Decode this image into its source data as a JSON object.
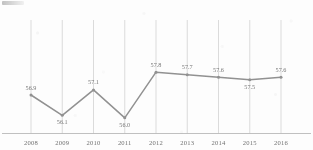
{
  "chart_data": {
    "type": "line",
    "title": "",
    "subtitle": "",
    "xlabel": "",
    "ylabel": "",
    "categories": [
      "2008",
      "2009",
      "2010",
      "2011",
      "2012",
      "2013",
      "2014",
      "2015",
      "2016"
    ],
    "values": [
      56.9,
      56.1,
      57.1,
      56.0,
      57.8,
      57.7,
      57.6,
      57.5,
      57.6
    ],
    "point_labels": [
      "56.9",
      "56.1",
      "57.1",
      "56.0",
      "57.8",
      "57.7",
      "57.6",
      "57.5",
      "57.6"
    ],
    "label_positions": [
      "above",
      "below",
      "above",
      "below",
      "above",
      "above",
      "above",
      "below",
      "above"
    ],
    "series": [
      {
        "name": "series-1",
        "values": [
          56.9,
          56.1,
          57.1,
          56.0,
          57.8,
          57.7,
          57.6,
          57.5,
          57.6
        ],
        "color": "#8b8b8b",
        "marker": "circle"
      }
    ],
    "ylim": [
      55.6,
      58.2
    ],
    "grid": {
      "vertical": true,
      "horizontal": false
    },
    "legend": {
      "visible": false,
      "position": "none"
    },
    "axis": {
      "x_visible": true,
      "y_visible": false
    },
    "colors": {
      "line": "#8b8b8b",
      "marker": "#8b8b8b",
      "gridline": "#cfcfcf",
      "axis": "#b9b9b9",
      "data_label": "#6e6e6e",
      "tick_label": "#676767",
      "background": "#fdfdfd"
    }
  }
}
